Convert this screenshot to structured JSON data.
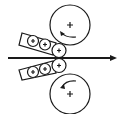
{
  "diagram": {
    "type": "rolling-mill-cluster-rolls",
    "stroke_color": "#1a1a1a",
    "background": "#ffffff",
    "strip_direction": "left-to-right",
    "large_rolls": [
      {
        "id": "top-backup-roll",
        "cx": 70,
        "cy": 25,
        "r": 20,
        "rotation": "counterclockwise-arrow",
        "marker": "+"
      },
      {
        "id": "bottom-backup-roll",
        "cx": 70,
        "cy": 94,
        "r": 20,
        "rotation": "counterclockwise-arrow",
        "marker": "+"
      }
    ],
    "clusters": [
      {
        "id": "top-cluster",
        "angle": 17,
        "rolls": [
          {
            "cx": 34,
            "cy": 41,
            "r": 6,
            "marker": "+"
          },
          {
            "cx": 45,
            "cy": 44,
            "r": 6,
            "marker": "+"
          },
          {
            "cx": 59,
            "cy": 50,
            "r": 7,
            "marker": "+"
          }
        ]
      },
      {
        "id": "bottom-cluster",
        "angle": -17,
        "rolls": [
          {
            "cx": 34,
            "cy": 72,
            "r": 6,
            "marker": "+"
          },
          {
            "cx": 45,
            "cy": 69,
            "r": 6,
            "marker": "+"
          },
          {
            "cx": 59,
            "cy": 65,
            "r": 7,
            "marker": "+"
          }
        ]
      }
    ],
    "strip_arrow": {
      "x1": 8,
      "y1": 58,
      "x2": 116,
      "y2": 58
    }
  }
}
